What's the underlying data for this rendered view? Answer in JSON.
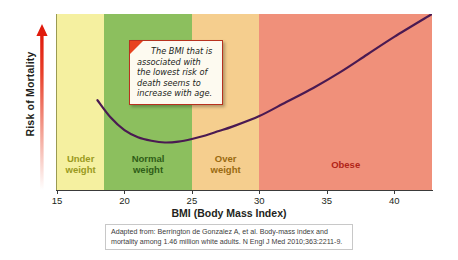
{
  "chart_data": {
    "type": "line",
    "title": "",
    "xlabel": "BMI (Body Mass Index)",
    "ylabel": "Risk of Mortality",
    "xlim": [
      15,
      42.8
    ],
    "ylim": [
      0,
      1
    ],
    "grid": false,
    "legend": "none",
    "xticks": [
      "15",
      "20",
      "25",
      "30",
      "35",
      "40"
    ],
    "xtick_values": [
      15,
      20,
      25,
      30,
      35,
      40
    ],
    "yticks": [],
    "series": [
      {
        "name": "Risk of mortality vs BMI",
        "color": "#4a1a52",
        "x": [
          18.0,
          19.0,
          20.0,
          21.0,
          22.0,
          23.0,
          24.0,
          25.0,
          26.0,
          27.0,
          28.0,
          30.0,
          32.0,
          34.0,
          36.0,
          38.0,
          40.0,
          42.8
        ],
        "y": [
          0.51,
          0.41,
          0.34,
          0.3,
          0.28,
          0.27,
          0.275,
          0.29,
          0.31,
          0.335,
          0.36,
          0.42,
          0.5,
          0.58,
          0.67,
          0.77,
          0.87,
          1.0
        ]
      }
    ],
    "bands": [
      {
        "label": "Under\nweight",
        "from": 15,
        "to": 18.5,
        "fill": "#F5F0A0",
        "text_color": "#9a9a20"
      },
      {
        "label": "Normal\nweight",
        "from": 18.5,
        "to": 25,
        "fill": "#8CBF5E",
        "text_color": "#2f5d17"
      },
      {
        "label": "Over\nweight",
        "from": 25,
        "to": 30,
        "fill": "#F5CE8E",
        "text_color": "#9a6a10"
      },
      {
        "label": "Obese",
        "from": 30,
        "to": 42.8,
        "fill": "#F0907A",
        "text_color": "#b02418"
      }
    ],
    "annotations": [
      {
        "name": "bmi-callout",
        "text": "The BMI that is associated with the lowest risk of death seems to increase with age.",
        "at_x": 22.0
      }
    ]
  },
  "axis": {
    "y_label": "Risk of Mortality",
    "x_title": "BMI (Body Mass Index)"
  },
  "callout": {
    "text": "The BMI that is associated with the lowest risk of death seems to increase with age."
  },
  "citation": {
    "text": "Adapted from: Berrington de Gonzalez A, et al. Body-mass index and mortality among 1.46 million white adults. N Engl J Med 2010;363:2211-9."
  }
}
